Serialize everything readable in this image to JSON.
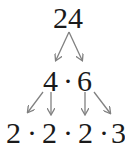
{
  "diagram": {
    "type": "factor-tree",
    "root": "24",
    "level1": {
      "left": "4",
      "dot": "·",
      "right": "6"
    },
    "level2": [
      "2",
      "2",
      "2",
      "3"
    ],
    "dot": "·",
    "arrow_color": "#808080",
    "text_color": "#1a1a1a"
  }
}
